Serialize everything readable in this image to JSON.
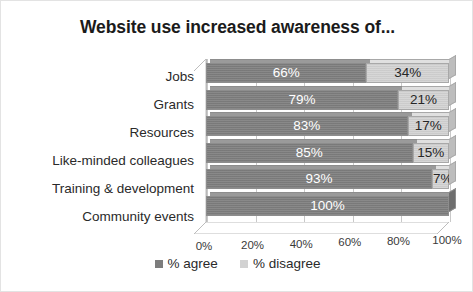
{
  "chart_data": {
    "type": "bar",
    "subtype": "stacked-horizontal-3d",
    "title": "Website use increased awareness of...",
    "xlabel": "",
    "ylabel": "",
    "xlim": [
      0,
      100
    ],
    "xticks": [
      "0%",
      "20%",
      "40%",
      "60%",
      "80%",
      "100%"
    ],
    "xtick_values": [
      0,
      20,
      40,
      60,
      80,
      100
    ],
    "grid": true,
    "legend_position": "bottom",
    "categories": [
      "Jobs",
      "Grants",
      "Resources",
      "Like-minded colleagues",
      "Training & development",
      "Community events"
    ],
    "series": [
      {
        "name": "% agree",
        "color": "#808080",
        "values": [
          66,
          79,
          83,
          85,
          93,
          100
        ],
        "labels": [
          "66%",
          "79%",
          "83%",
          "85%",
          "93%",
          "100%"
        ]
      },
      {
        "name": "% disagree",
        "color": "#d2d2d2",
        "values": [
          34,
          21,
          17,
          15,
          7,
          0
        ],
        "labels": [
          "34%",
          "21%",
          "17%",
          "15%",
          "7%",
          ""
        ]
      }
    ]
  },
  "legend": {
    "items": [
      {
        "label": "% agree",
        "color": "#808080"
      },
      {
        "label": "% disagree",
        "color": "#d2d2d2"
      }
    ]
  }
}
